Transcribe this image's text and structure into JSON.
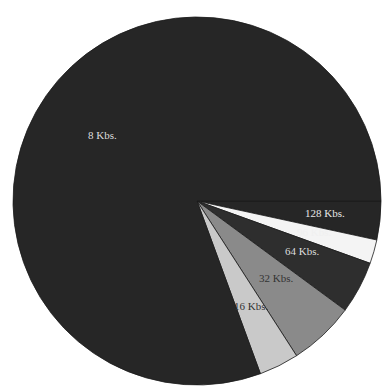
{
  "chart_data": {
    "type": "pie",
    "title": "",
    "start_angle_deg": 0,
    "direction": "clockwise",
    "slices": [
      {
        "label": "128 Kbs.",
        "percent": 3.4,
        "color": "#262626",
        "label_color": "#e6e6e6",
        "label_pos": [
          305,
          217
        ]
      },
      {
        "label": "96 Kbs.",
        "percent": 2.1,
        "color": "#f4f4f4",
        "label_color": "#f0f0f0",
        "label_pos": [
          297,
          236
        ]
      },
      {
        "label": "64 Kbs.",
        "percent": 4.6,
        "color": "#2e2e2e",
        "label_color": "#dddddd",
        "label_pos": [
          285,
          255
        ]
      },
      {
        "label": "32 Kbs.",
        "percent": 5.8,
        "color": "#8a8a8a",
        "label_color": "#333333",
        "label_pos": [
          259,
          282
        ]
      },
      {
        "label": "16 Kbs.",
        "percent": 3.5,
        "color": "#c9c9c9",
        "label_color": "#333333",
        "label_pos": [
          234,
          310
        ]
      },
      {
        "label": "8 Kbs.",
        "percent": 80.6,
        "color": "#262626",
        "label_color": "#dddddd",
        "label_pos": [
          88,
          139
        ]
      }
    ],
    "legend": "none"
  }
}
